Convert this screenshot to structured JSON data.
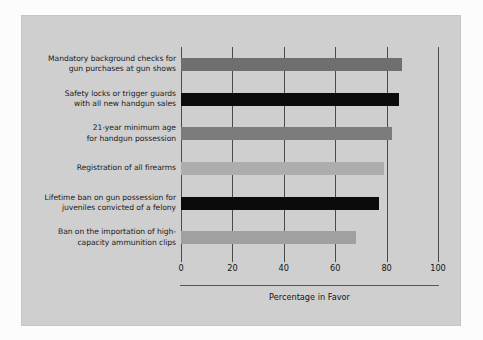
{
  "chart_data": {
    "type": "bar",
    "orientation": "horizontal",
    "title": "",
    "xlabel": "Percentage in Favor",
    "ylabel": "",
    "xlim": [
      0,
      100
    ],
    "xticks": [
      0,
      20,
      40,
      60,
      80,
      100
    ],
    "xtick_labels": [
      "0",
      "20",
      "40",
      "60",
      "80",
      "100"
    ],
    "grid": "vertical",
    "legend": "none",
    "categories": [
      "Mandatory background checks for gun purchases at gun shows",
      "Safety locks or trigger guards with all new handgun sales",
      "21-year minimum age for handgun possession",
      "Registration of all firearms",
      "Lifetime ban on gun possession for juveniles convicted of a felony",
      "Ban on the importation of high-capacity ammunition clips"
    ],
    "category_lines": [
      [
        "Mandatory background checks for",
        "gun purchases at gun shows"
      ],
      [
        "Safety locks or trigger guards",
        "with all new handgun sales"
      ],
      [
        "21-year minimum age",
        "for handgun possession"
      ],
      [
        "Registration of all firearms"
      ],
      [
        "Lifetime ban on gun possession for",
        "juveniles convicted of a felony"
      ],
      [
        "Ban on the importation of high-",
        "capacity ammunition clips"
      ]
    ],
    "values": [
      86,
      85,
      82,
      79,
      77,
      68
    ],
    "bar_colors": [
      "#6f6f6f",
      "#0b0b0b",
      "#7c7c7c",
      "#adadad",
      "#0b0b0b",
      "#a0a0a0"
    ]
  },
  "figure": {
    "panel_color": "#cfcfcf",
    "background_color": "#fcfcfc",
    "axis_color": "#4a4a4a"
  }
}
